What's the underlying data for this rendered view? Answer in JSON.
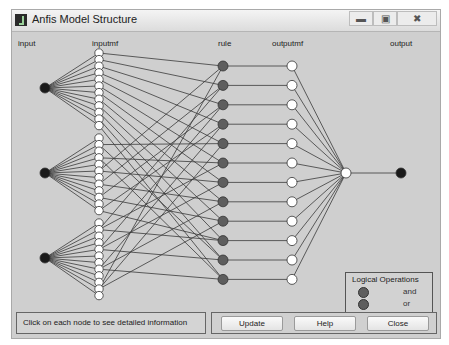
{
  "window": {
    "title": "Anfis Model Structure",
    "controls": {
      "minimize": "minimize-icon",
      "maximize": "maximize-icon",
      "close": "close-icon"
    }
  },
  "columns": {
    "input": "input",
    "inputmf": "inputmf",
    "rule": "rule",
    "outputmf": "outputmf",
    "output": "output"
  },
  "network": {
    "input_count": 3,
    "inputmf_per_input": 12,
    "rule_count": 12,
    "outputmf_count": 12,
    "output_count": 1,
    "colors": {
      "input_node": "#1a1a1a",
      "inputmf_node": "#ffffff",
      "rule_node": "#5e5e5e",
      "outputmf_node": "#ffffff",
      "aggregate_node": "#ffffff",
      "output_node": "#1a1a1a",
      "edge": "#3a3a3a"
    }
  },
  "legend": {
    "title": "Logical Operations",
    "items": [
      {
        "label": "and",
        "color": "#5e5e5e"
      },
      {
        "label": "or",
        "color": "#5e5e5e"
      },
      {
        "label": "not"
      }
    ]
  },
  "status": {
    "text": "Click on each node to see detailed information"
  },
  "buttons": {
    "update": "Update",
    "help": "Help",
    "close": "Close"
  }
}
